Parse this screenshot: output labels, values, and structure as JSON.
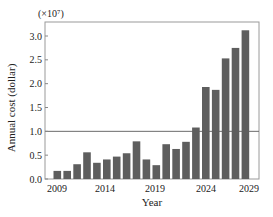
{
  "chart_data": {
    "type": "bar",
    "title": "",
    "xlabel": "Year",
    "ylabel": "Annual cost (dollar)",
    "y_multiplier_label": "(×10⁷)",
    "ylim": [
      0,
      3.2
    ],
    "yticks": [
      0.0,
      0.5,
      1.0,
      1.5,
      2.0,
      2.5,
      3.0
    ],
    "ytick_labels": [
      "0.0",
      "0.5",
      "1.0",
      "1.5",
      "2.0",
      "2.5",
      "3.0"
    ],
    "xtick_labels": [
      "2009",
      "2014",
      "2019",
      "2024",
      "2029"
    ],
    "reference_line": 1.0,
    "grid": false,
    "legend": null,
    "categories": [
      "2009",
      "2010",
      "2011",
      "2012",
      "2013",
      "2014",
      "2015",
      "2016",
      "2017",
      "2018",
      "2019",
      "2020",
      "2021",
      "2022",
      "2023",
      "2024",
      "2025",
      "2026",
      "2027",
      "2028"
    ],
    "values": [
      0.17,
      0.17,
      0.31,
      0.56,
      0.34,
      0.41,
      0.47,
      0.54,
      0.79,
      0.41,
      0.29,
      0.73,
      0.63,
      0.78,
      1.08,
      1.93,
      1.87,
      2.53,
      2.75,
      3.12
    ],
    "bar_color": "#5e5e5e"
  },
  "labels": {
    "multiplier": "(×10⁷)",
    "xlabel": "Year",
    "ylabel": "Annual cost (dollar)"
  }
}
